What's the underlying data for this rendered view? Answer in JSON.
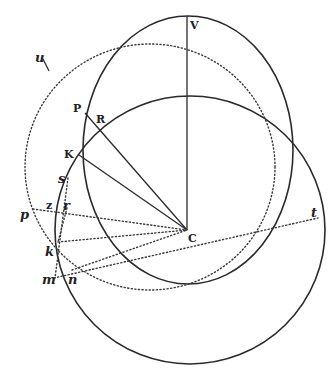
{
  "figure": {
    "colors": {
      "ink": "#2a2a2a",
      "background": "#ffffff"
    },
    "labels": {
      "V": "V",
      "P": "P",
      "R": "R",
      "K": "K",
      "s": "s",
      "u": "u",
      "z": "z",
      "r": "r",
      "p": "p",
      "k": "k",
      "m": "m",
      "n": "n",
      "C": "C",
      "t": "t"
    },
    "points": {
      "V": [
        187,
        16
      ],
      "C": [
        187,
        230
      ],
      "P": [
        85,
        113
      ],
      "R": [
        100,
        124
      ],
      "K": [
        79,
        155
      ],
      "u": [
        46,
        65
      ],
      "p": [
        33,
        212
      ],
      "z": [
        62,
        206
      ],
      "r": [
        66,
        208
      ],
      "k": [
        58,
        245
      ],
      "m": [
        54,
        278
      ],
      "n": [
        71,
        277
      ],
      "t": [
        318,
        218
      ]
    },
    "curves": [
      {
        "id": "upper-ellipse",
        "style": "solid",
        "cx": 188,
        "cy": 150,
        "rx": 105,
        "ry": 134
      },
      {
        "id": "lower-circle",
        "style": "solid",
        "cx": 190,
        "cy": 230,
        "rx": 135,
        "ry": 134
      },
      {
        "id": "dotted-ellipse",
        "style": "dotted",
        "cx": 150,
        "cy": 167,
        "rx": 125,
        "ry": 123
      }
    ],
    "lines": [
      {
        "id": "V-C",
        "style": "solid",
        "from": "V",
        "to": "C"
      },
      {
        "id": "P-C",
        "style": "solid",
        "from": "P",
        "to": "C"
      },
      {
        "id": "K-C",
        "style": "solid",
        "from": "K",
        "to": "C"
      },
      {
        "id": "p-C",
        "style": "dotted",
        "from": "p",
        "to": "C"
      },
      {
        "id": "k-C",
        "style": "dotted",
        "from": "k",
        "to": "C"
      },
      {
        "id": "m-t",
        "style": "dotted",
        "from": "m",
        "to": "t"
      },
      {
        "id": "n-C",
        "style": "dotted",
        "from": "n",
        "to": "C"
      },
      {
        "id": "s-m",
        "style": "dotted",
        "from": "s",
        "to": "m"
      },
      {
        "id": "r-k",
        "style": "dotted",
        "from": "r",
        "to": "k"
      }
    ]
  }
}
